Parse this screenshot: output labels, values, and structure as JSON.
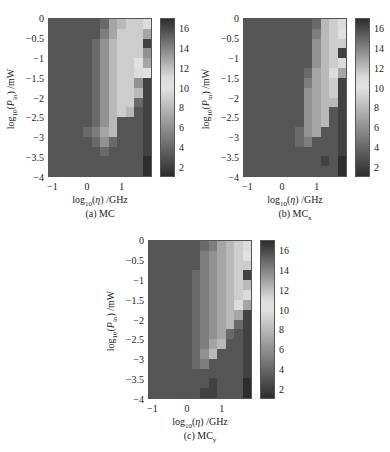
{
  "figure": {
    "panels": [
      {
        "id": "a",
        "caption": "(a) MC",
        "caption_main": "(a) MC",
        "caption_sub": ""
      },
      {
        "id": "b",
        "caption": "(b) MCx",
        "caption_main": "(b) MC",
        "caption_sub": "x"
      },
      {
        "id": "c",
        "caption": "(c) MCy",
        "caption_main": "(c) MC",
        "caption_sub": "y"
      }
    ],
    "xlabel": "log10(η) /GHz",
    "ylabel": "log10(P_in) /mW",
    "xticks": [
      "-1",
      "0",
      "1"
    ],
    "yticks": [
      "0",
      "-0.5",
      "-1",
      "-1.5",
      "-2",
      "-2.5",
      "-3",
      "-3.5",
      "-4"
    ],
    "colorbar_ticks": [
      "16",
      "14",
      "12",
      "10",
      "8",
      "6",
      "4",
      "2"
    ]
  },
  "chart_data": [
    {
      "type": "heatmap",
      "title": "(a) MC",
      "xlabel": "log10(η) /GHz",
      "ylabel": "log10(P_in) /mW",
      "x": [
        -1,
        -0.75,
        -0.5,
        -0.25,
        0,
        0.25,
        0.5,
        0.75,
        1,
        1.25,
        1.5,
        1.75
      ],
      "y": [
        0,
        -0.25,
        -0.5,
        -0.75,
        -1,
        -1.25,
        -1.5,
        -1.75,
        -2,
        -2.25,
        -2.5,
        -2.75,
        -3,
        -3.25,
        -3.5,
        -3.75
      ],
      "xlim": [
        -1.125,
        1.875
      ],
      "ylim": [
        -4,
        0
      ],
      "colorbar": {
        "range": [
          1,
          17
        ],
        "ticks": [
          2,
          4,
          6,
          8,
          10,
          12,
          14,
          16
        ]
      },
      "z": [
        [
          3,
          3,
          3,
          3,
          3,
          3,
          4,
          7,
          8,
          9,
          9,
          11
        ],
        [
          3,
          3,
          3,
          3,
          3,
          3,
          5,
          7,
          9,
          9,
          9,
          7
        ],
        [
          3,
          3,
          3,
          3,
          3,
          4,
          6,
          8,
          9,
          9,
          9,
          2
        ],
        [
          3,
          3,
          3,
          3,
          3,
          4,
          6,
          8,
          9,
          9,
          9,
          6
        ],
        [
          3,
          3,
          3,
          3,
          3,
          4,
          6,
          8,
          9,
          9,
          10,
          7
        ],
        [
          3,
          3,
          3,
          3,
          3,
          4,
          6,
          8,
          9,
          9,
          11,
          10
        ],
        [
          3,
          3,
          3,
          3,
          3,
          4,
          6,
          8,
          9,
          9,
          6,
          2
        ],
        [
          3,
          3,
          3,
          3,
          3,
          4,
          6,
          8,
          9,
          9,
          8,
          2
        ],
        [
          3,
          3,
          3,
          3,
          3,
          4,
          6,
          8,
          9,
          9,
          4,
          2
        ],
        [
          3,
          3,
          3,
          3,
          3,
          4,
          6,
          8,
          9,
          8,
          3,
          2
        ],
        [
          3,
          3,
          3,
          3,
          3,
          4,
          6,
          8,
          3,
          3,
          3,
          2
        ],
        [
          3,
          3,
          3,
          3,
          4,
          5,
          7,
          8,
          3,
          3,
          3,
          2
        ],
        [
          3,
          3,
          3,
          3,
          3,
          4,
          6,
          4,
          3,
          3,
          3,
          2
        ],
        [
          3,
          3,
          3,
          3,
          3,
          3,
          4,
          3,
          3,
          3,
          3,
          2
        ],
        [
          3,
          3,
          3,
          3,
          3,
          3,
          3,
          3,
          3,
          3,
          3,
          1
        ],
        [
          3,
          3,
          3,
          3,
          3,
          3,
          3,
          3,
          3,
          3,
          3,
          1
        ]
      ]
    },
    {
      "type": "heatmap",
      "title": "(b) MCx",
      "xlabel": "log10(η) /GHz",
      "ylabel": "log10(P_in) /mW",
      "x": [
        -1,
        -0.75,
        -0.5,
        -0.25,
        0,
        0.25,
        0.5,
        0.75,
        1,
        1.25,
        1.5,
        1.75
      ],
      "y": [
        0,
        -0.25,
        -0.5,
        -0.75,
        -1,
        -1.25,
        -1.5,
        -1.75,
        -2,
        -2.25,
        -2.5,
        -2.75,
        -3,
        -3.25,
        -3.5,
        -3.75
      ],
      "xlim": [
        -1.125,
        1.875
      ],
      "ylim": [
        -4,
        0
      ],
      "colorbar": {
        "range": [
          1,
          17
        ],
        "ticks": [
          2,
          4,
          6,
          8,
          10,
          12,
          14,
          16
        ]
      },
      "z": [
        [
          3,
          3,
          3,
          3,
          3,
          3,
          3,
          3,
          4,
          8,
          9,
          11
        ],
        [
          3,
          3,
          3,
          3,
          3,
          3,
          3,
          3,
          5,
          8,
          9,
          10
        ],
        [
          3,
          3,
          3,
          3,
          3,
          3,
          3,
          3,
          6,
          8,
          9,
          9
        ],
        [
          3,
          3,
          3,
          3,
          3,
          3,
          3,
          3,
          6,
          8,
          9,
          2
        ],
        [
          3,
          3,
          3,
          3,
          3,
          3,
          3,
          3,
          6,
          8,
          9,
          11
        ],
        [
          3,
          3,
          3,
          3,
          3,
          3,
          3,
          4,
          7,
          8,
          11,
          7
        ],
        [
          3,
          3,
          3,
          3,
          3,
          3,
          3,
          5,
          7,
          8,
          9,
          2
        ],
        [
          3,
          3,
          3,
          3,
          3,
          3,
          3,
          6,
          7,
          8,
          9,
          2
        ],
        [
          3,
          3,
          3,
          3,
          3,
          3,
          3,
          6,
          7,
          8,
          8,
          2
        ],
        [
          3,
          3,
          3,
          3,
          3,
          3,
          3,
          6,
          7,
          8,
          3,
          2
        ],
        [
          3,
          3,
          3,
          3,
          3,
          3,
          3,
          6,
          7,
          8,
          3,
          2
        ],
        [
          3,
          3,
          3,
          3,
          3,
          3,
          4,
          6,
          7,
          3,
          3,
          2
        ],
        [
          3,
          3,
          3,
          3,
          3,
          3,
          4,
          5,
          3,
          3,
          3,
          2
        ],
        [
          3,
          3,
          3,
          3,
          3,
          3,
          3,
          3,
          3,
          3,
          3,
          2
        ],
        [
          3,
          3,
          3,
          3,
          3,
          3,
          3,
          3,
          3,
          2,
          3,
          1
        ],
        [
          3,
          3,
          3,
          3,
          3,
          3,
          3,
          3,
          3,
          3,
          3,
          1
        ]
      ]
    },
    {
      "type": "heatmap",
      "title": "(c) MCy",
      "xlabel": "log10(η) /GHz",
      "ylabel": "log10(P_in) /mW",
      "x": [
        -1,
        -0.75,
        -0.5,
        -0.25,
        0,
        0.25,
        0.5,
        0.75,
        1,
        1.25,
        1.5,
        1.75
      ],
      "y": [
        0,
        -0.25,
        -0.5,
        -0.75,
        -1,
        -1.25,
        -1.5,
        -1.75,
        -2,
        -2.25,
        -2.5,
        -2.75,
        -3,
        -3.25,
        -3.5,
        -3.75
      ],
      "xlim": [
        -1.125,
        1.875
      ],
      "ylim": [
        -4,
        0
      ],
      "colorbar": {
        "range": [
          1,
          17
        ],
        "ticks": [
          2,
          4,
          6,
          8,
          10,
          12,
          14,
          16
        ]
      },
      "z": [
        [
          3,
          3,
          3,
          3,
          3,
          3,
          4,
          5,
          7,
          8,
          9,
          11
        ],
        [
          3,
          3,
          3,
          3,
          3,
          3,
          5,
          6,
          7,
          8,
          9,
          10
        ],
        [
          3,
          3,
          3,
          3,
          3,
          3,
          5,
          6,
          7,
          8,
          9,
          9
        ],
        [
          3,
          3,
          3,
          3,
          3,
          4,
          5,
          6,
          7,
          8,
          9,
          2
        ],
        [
          3,
          3,
          3,
          3,
          3,
          4,
          5,
          6,
          7,
          8,
          9,
          8
        ],
        [
          3,
          3,
          3,
          3,
          3,
          4,
          5,
          6,
          7,
          8,
          9,
          11
        ],
        [
          3,
          3,
          3,
          3,
          3,
          4,
          5,
          6,
          7,
          8,
          11,
          7
        ],
        [
          3,
          3,
          3,
          3,
          3,
          4,
          5,
          6,
          7,
          8,
          7,
          2
        ],
        [
          3,
          3,
          3,
          3,
          3,
          4,
          5,
          6,
          7,
          8,
          4,
          2
        ],
        [
          3,
          3,
          3,
          3,
          3,
          4,
          5,
          6,
          7,
          4,
          3,
          2
        ],
        [
          3,
          3,
          3,
          3,
          3,
          4,
          5,
          7,
          8,
          3,
          3,
          2
        ],
        [
          3,
          3,
          3,
          3,
          3,
          4,
          6,
          8,
          3,
          3,
          3,
          2
        ],
        [
          3,
          3,
          3,
          3,
          3,
          4,
          5,
          3,
          3,
          3,
          3,
          2
        ],
        [
          3,
          3,
          3,
          3,
          3,
          3,
          3,
          3,
          3,
          3,
          3,
          2
        ],
        [
          3,
          3,
          3,
          3,
          3,
          3,
          3,
          2,
          3,
          3,
          3,
          1
        ],
        [
          3,
          3,
          3,
          3,
          3,
          3,
          2,
          2,
          3,
          3,
          3,
          1
        ]
      ]
    }
  ]
}
